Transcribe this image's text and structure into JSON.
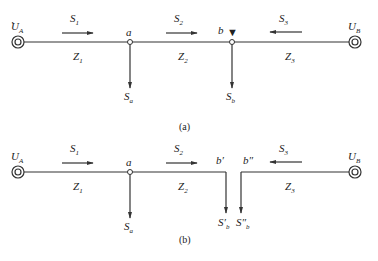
{
  "diagram_a": {
    "caption": "(a)",
    "source_left": {
      "label": "U",
      "sub": "A"
    },
    "source_right": {
      "label": "U",
      "sub": "B"
    },
    "flows": [
      {
        "label": "S",
        "sub": "1",
        "direction": "right"
      },
      {
        "label": "S",
        "sub": "2",
        "direction": "right"
      },
      {
        "label": "S",
        "sub": "3",
        "direction": "left"
      }
    ],
    "impedances": [
      {
        "label": "Z",
        "sub": "1"
      },
      {
        "label": "Z",
        "sub": "2"
      },
      {
        "label": "Z",
        "sub": "3"
      }
    ],
    "nodes": [
      {
        "label": "a"
      },
      {
        "label": "b",
        "marker": "▼"
      }
    ],
    "loads": [
      {
        "label": "S",
        "sub": "a"
      },
      {
        "label": "S",
        "sub": "b"
      }
    ]
  },
  "diagram_b": {
    "caption": "(b)",
    "source_left": {
      "label": "U",
      "sub": "A"
    },
    "source_right": {
      "label": "U",
      "sub": "B"
    },
    "flows": [
      {
        "label": "S",
        "sub": "1",
        "direction": "right"
      },
      {
        "label": "S",
        "sub": "2",
        "direction": "right"
      },
      {
        "label": "S",
        "sub": "3",
        "direction": "left"
      }
    ],
    "impedances": [
      {
        "label": "Z",
        "sub": "1"
      },
      {
        "label": "Z",
        "sub": "2"
      },
      {
        "label": "Z",
        "sub": "3"
      }
    ],
    "nodes": [
      {
        "label": "a"
      },
      {
        "label": "b′"
      },
      {
        "label": "b″"
      }
    ],
    "loads": [
      {
        "label": "S",
        "sub": "a"
      },
      {
        "label": "S′",
        "sub": "b"
      },
      {
        "label": "S″",
        "sub": "b"
      }
    ]
  },
  "colors": {
    "line": "#333333",
    "text": "#222222"
  }
}
